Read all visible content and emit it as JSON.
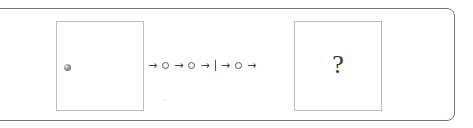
{
  "diagram": {
    "start_box": {
      "content": "ball"
    },
    "sequence": [
      {
        "type": "arrow",
        "glyph": "→"
      },
      {
        "type": "circle"
      },
      {
        "type": "arrow",
        "glyph": "→"
      },
      {
        "type": "circle"
      },
      {
        "type": "arrow",
        "glyph": "→"
      },
      {
        "type": "bar"
      },
      {
        "type": "arrow",
        "glyph": "→"
      },
      {
        "type": "circle"
      },
      {
        "type": "arrow",
        "glyph": "→"
      }
    ],
    "end_box": {
      "label": "?"
    },
    "arrow_glyph": "→"
  }
}
